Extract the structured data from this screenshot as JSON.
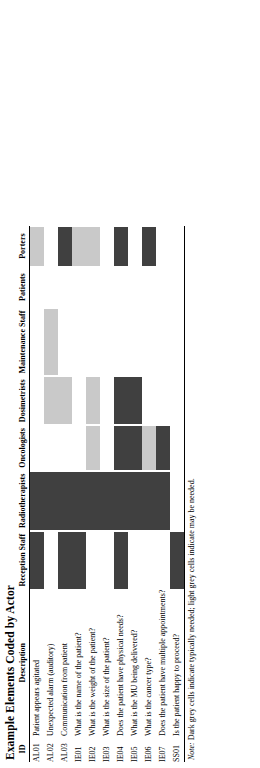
{
  "figure": {
    "title": "Example Elements Coded by Actor",
    "note_label": "Note:",
    "note_text": "Dark grey cells indicate typically needed; light grey cells indicate may be needed.",
    "colors": {
      "dark_grey": "#404040",
      "light_grey": "#c9c9c9",
      "empty": "#ffffff",
      "text": "#000000"
    },
    "columns": {
      "id_header": "ID",
      "description_header": "Description",
      "actors": [
        "Reception Staff",
        "Radiotherapists",
        "Oncologists",
        "Dosimetrists",
        "Maintenance Staff",
        "Patients",
        "Porters"
      ]
    },
    "legend": {
      "dark": "typically needed",
      "light": "may be needed",
      "empty": "not needed"
    },
    "rows": [
      {
        "id": "AL01",
        "description": "Patient appears agitated",
        "cells": [
          "dark",
          "dark",
          "none",
          "none",
          "none",
          "none",
          "light"
        ]
      },
      {
        "id": "AL02",
        "description": "Unexpected alarm (auditory)",
        "cells": [
          "none",
          "dark",
          "none",
          "light",
          "light",
          "none",
          "none"
        ]
      },
      {
        "id": "AL03",
        "description": "Communication from patient",
        "cells": [
          "dark",
          "dark",
          "none",
          "light",
          "none",
          "none",
          "dark"
        ]
      },
      {
        "id": "IE01",
        "description": "What is the name of the patient?",
        "cells": [
          "dark",
          "dark",
          "none",
          "none",
          "none",
          "none",
          "light"
        ]
      },
      {
        "id": "IE02",
        "description": "What is the weight of the patient?",
        "cells": [
          "none",
          "dark",
          "light",
          "light",
          "none",
          "none",
          "light"
        ]
      },
      {
        "id": "IE03",
        "description": "What is the size of the patient?",
        "cells": [
          "none",
          "dark",
          "none",
          "none",
          "none",
          "none",
          "none"
        ]
      },
      {
        "id": "IE04",
        "description": "Does the patient have physical needs?",
        "cells": [
          "dark",
          "dark",
          "dark",
          "dark",
          "none",
          "none",
          "dark"
        ]
      },
      {
        "id": "IE05",
        "description": "What is the MU being delivered?",
        "cells": [
          "none",
          "dark",
          "dark",
          "dark",
          "none",
          "none",
          "none"
        ]
      },
      {
        "id": "IE06",
        "description": "What is the cancer type?",
        "cells": [
          "none",
          "dark",
          "light",
          "none",
          "none",
          "none",
          "dark"
        ]
      },
      {
        "id": "IE07",
        "description": "Does the patient have multiple appointments?",
        "cells": [
          "none",
          "dark",
          "dark",
          "none",
          "none",
          "none",
          "none"
        ]
      },
      {
        "id": "SS01",
        "description": "Is the patient happy to proceed?",
        "cells": [
          "dark",
          "none",
          "none",
          "none",
          "none",
          "none",
          "none"
        ]
      }
    ]
  }
}
